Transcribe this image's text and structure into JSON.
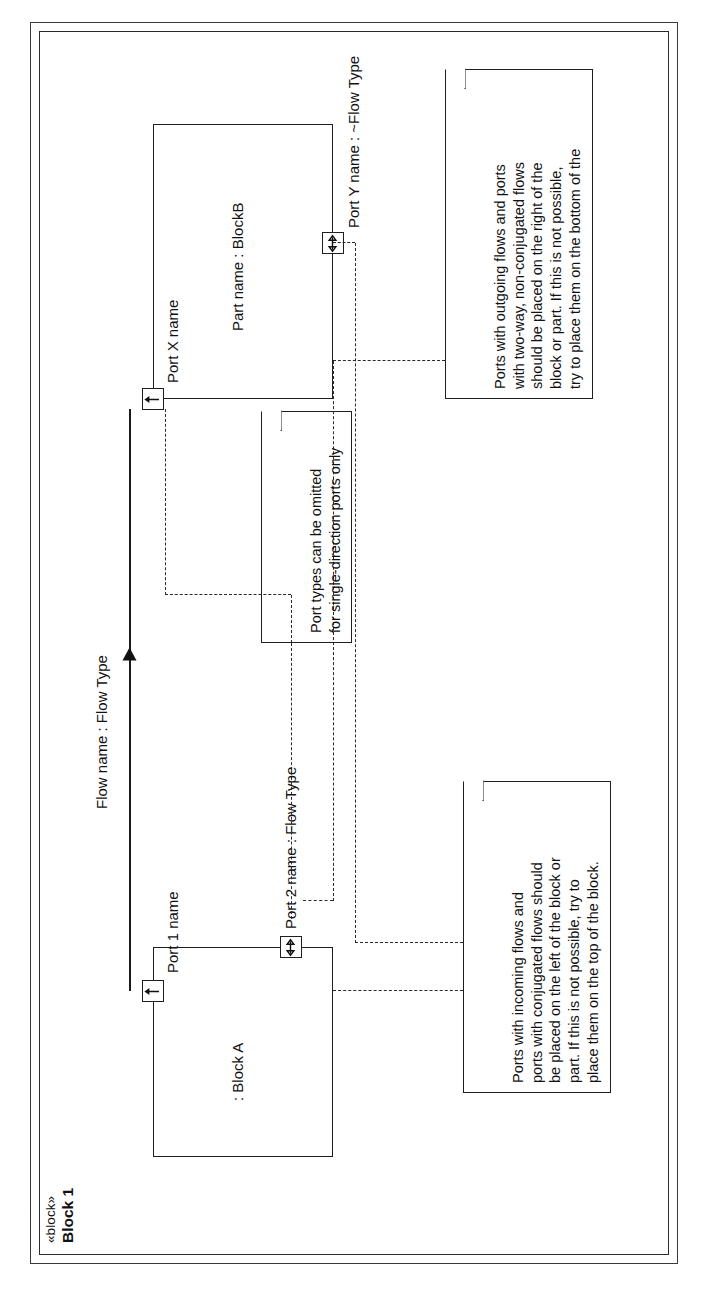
{
  "diagram": {
    "kind": "sysml-internal-block-diagram",
    "orientation": "rotated-90-ccw",
    "stereotype": "«block»",
    "title": "Block 1"
  },
  "parts": [
    {
      "id": "block_a",
      "label": ": Block A"
    },
    {
      "id": "block_b",
      "label": "Part name : BlockB"
    }
  ],
  "ports": [
    {
      "id": "port_1",
      "label": "Port 1 name",
      "icon": "arrow-out-port-icon",
      "direction": "out"
    },
    {
      "id": "port_2",
      "label": "Port 2 name : Flow Type",
      "icon": "bidirectional-port-icon",
      "direction": "inout"
    },
    {
      "id": "port_x",
      "label": "Port X name",
      "icon": "arrow-in-port-icon",
      "direction": "in"
    },
    {
      "id": "port_y",
      "label": "Port Y name : ~Flow Type",
      "icon": "bidirectional-port-icon",
      "direction": "inout"
    }
  ],
  "flows": [
    {
      "id": "flow_1",
      "label": "Flow name : Flow Type"
    }
  ],
  "notes": [
    {
      "id": "note_incoming",
      "text": "Ports with incoming flows and\nports with conjugated flows should\nbe placed on the left of the block or\npart. If this is not possible, try to\nplace them on the top of the block."
    },
    {
      "id": "note_port_types",
      "text": "Port types can be omitted\nfor single-direction ports only"
    },
    {
      "id": "note_outgoing",
      "text": "Ports with outgoing flows and ports\nwith two-way, non-conjugated flows\nshould be placed on the right of the\nblock or part. If this is not possible,\ntry to place them on the bottom of the"
    }
  ],
  "colors": {
    "line": "#1f1f1f",
    "frame": "#3a3a3a",
    "text": "#111111",
    "background": "#ffffff"
  }
}
